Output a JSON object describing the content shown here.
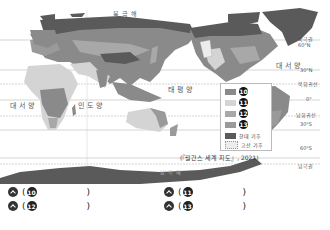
{
  "map": {
    "ocean_labels": {
      "arctic": "북극해",
      "atlantic_left": "대서양",
      "indian": "인도양",
      "pacific": "태평양",
      "atlantic_right": "대서양",
      "antarctica": "남극해"
    },
    "latitude_labels": {
      "arctic_circle": "북극권",
      "n60": "60°N",
      "n30": "30°N",
      "tropic_cancer": "북회귀선",
      "equator": "0°",
      "tropic_capricorn": "남회귀선",
      "s30": "30°S",
      "s60": "60°S",
      "antarctic_circle": "남극권"
    },
    "legend": [
      {
        "marker": "⑩",
        "num": "10",
        "color": "#8a8a8a"
      },
      {
        "marker": "⑪",
        "num": "11",
        "color": "#d4d4d4"
      },
      {
        "marker": "⑫",
        "num": "12",
        "color": "#a8a8a8"
      },
      {
        "marker": "⑬",
        "num": "13",
        "color": "#9a9a9a"
      },
      {
        "label": "한대 기후",
        "color": "#5a5a5a"
      },
      {
        "label": "고산 기후",
        "color": "#ececec"
      }
    ],
    "source": "(『월간스 세계 지도』, 2021)"
  },
  "answers": [
    {
      "num": "10",
      "open": "(",
      "close": ")"
    },
    {
      "num": "11",
      "open": "(",
      "close": ")"
    },
    {
      "num": "12",
      "open": "(",
      "close": ")"
    },
    {
      "num": "13",
      "open": "(",
      "close": ")"
    }
  ]
}
